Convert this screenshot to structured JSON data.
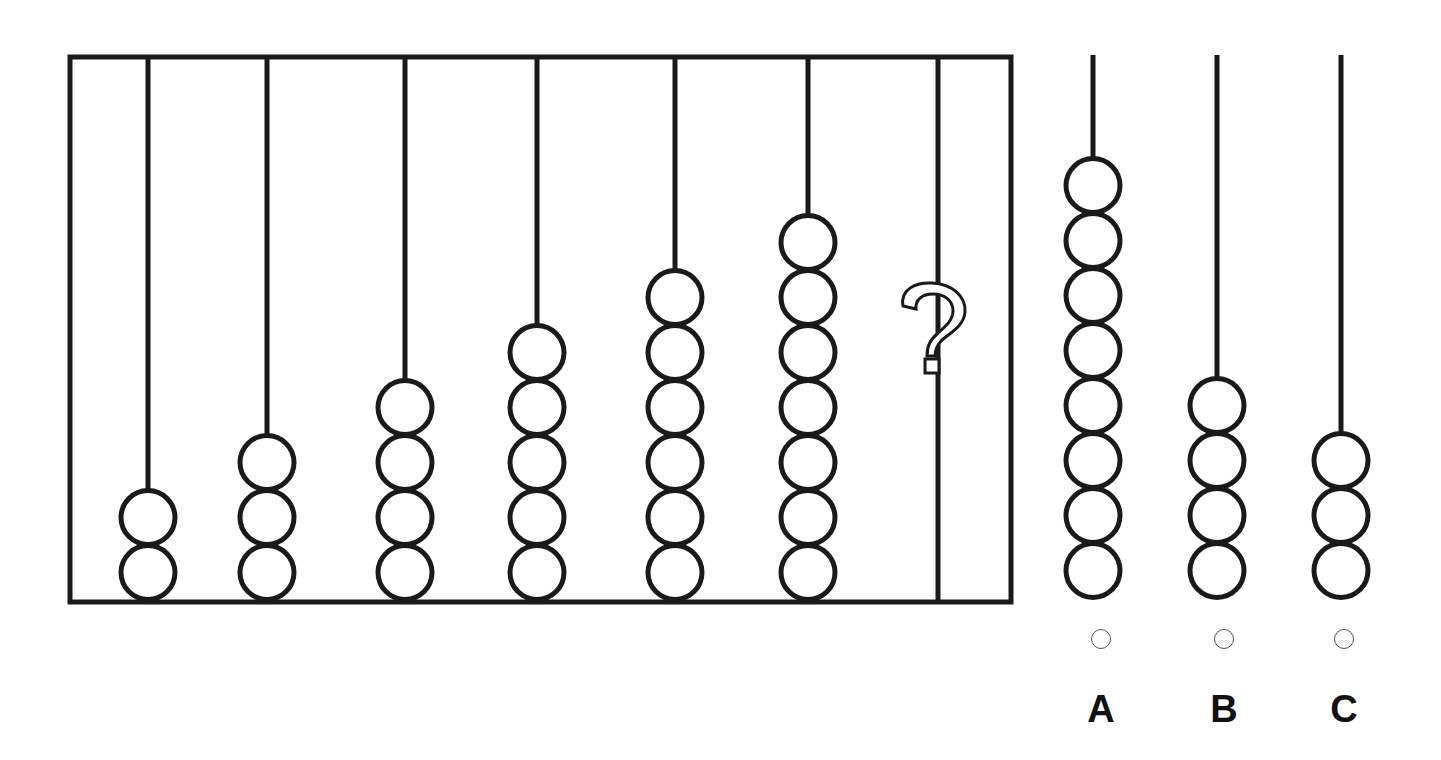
{
  "puzzle": {
    "type": "abacus-sequence",
    "frame_rods": [
      {
        "index": 1,
        "beads": 2
      },
      {
        "index": 2,
        "beads": 3
      },
      {
        "index": 3,
        "beads": 4
      },
      {
        "index": 4,
        "beads": 5
      },
      {
        "index": 5,
        "beads": 6
      },
      {
        "index": 6,
        "beads": 7
      },
      {
        "index": 7,
        "beads": null,
        "marker": "?"
      }
    ],
    "question_mark": "?",
    "options": [
      {
        "label": "A",
        "beads": 8
      },
      {
        "label": "B",
        "beads": 4
      },
      {
        "label": "C",
        "beads": 3
      }
    ]
  },
  "colors": {
    "stroke": "#1a1a1a",
    "background": "#ffffff",
    "radio_border": "#555555"
  }
}
